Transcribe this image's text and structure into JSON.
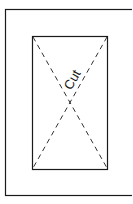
{
  "diagram": {
    "cut_label": "Cut",
    "line_color": "#1a1a1a",
    "background": "#ffffff",
    "outer_frame": {
      "x": 5,
      "y": 9,
      "width": 130,
      "height": 186
    },
    "inner_rect": {
      "x": 32,
      "y": 36,
      "width": 75,
      "height": 133
    }
  }
}
